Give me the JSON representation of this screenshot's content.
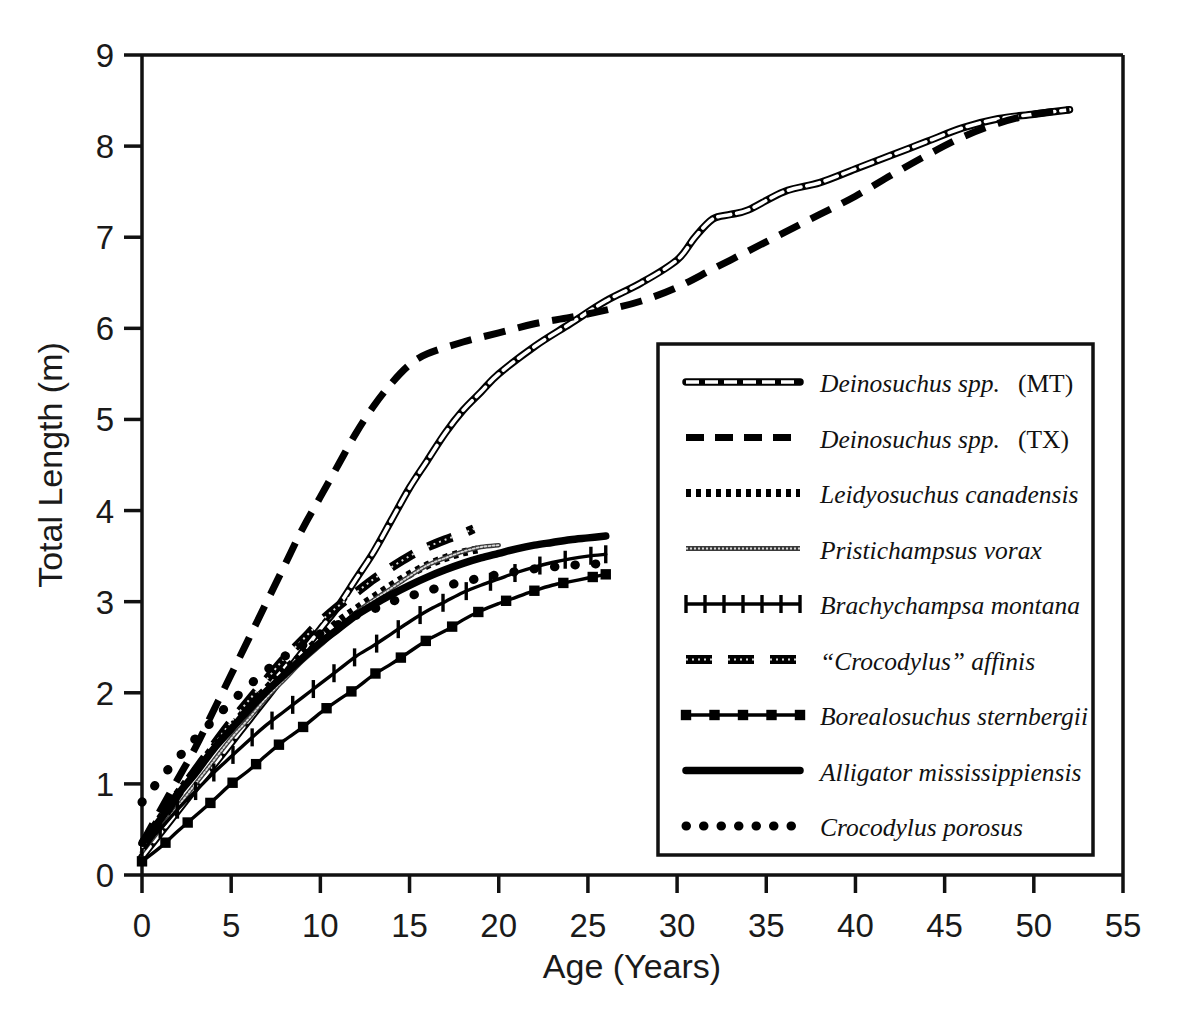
{
  "chart_data": {
    "type": "line",
    "title": "",
    "xlabel": "Age (Years)",
    "ylabel": "Total Length (m)",
    "xlim": [
      0,
      55
    ],
    "ylim": [
      0,
      9
    ],
    "xticks": [
      "0",
      "5",
      "10",
      "15",
      "20",
      "25",
      "30",
      "35",
      "40",
      "45",
      "50",
      "55"
    ],
    "yticks": [
      "0",
      "1",
      "2",
      "3",
      "4",
      "5",
      "6",
      "7",
      "8",
      "9"
    ],
    "grid": false,
    "legend_position": "inside-lower-right",
    "series": [
      {
        "name": "Deinosuchus spp.   (MT)",
        "style": "open-chain",
        "x": [
          0,
          1,
          2,
          3,
          4,
          5,
          6,
          7,
          8,
          9,
          10,
          11,
          12,
          13,
          14,
          15,
          16,
          17,
          18,
          19,
          20,
          22,
          24,
          26,
          28,
          30,
          31,
          32,
          33,
          34,
          36,
          38,
          40,
          42,
          44,
          46,
          48,
          50,
          52
        ],
        "y": [
          0.2,
          0.45,
          0.7,
          0.95,
          1.2,
          1.45,
          1.7,
          1.95,
          2.2,
          2.45,
          2.7,
          2.95,
          3.25,
          3.55,
          3.9,
          4.25,
          4.55,
          4.85,
          5.1,
          5.3,
          5.5,
          5.8,
          6.05,
          6.3,
          6.5,
          6.75,
          7.0,
          7.2,
          7.25,
          7.3,
          7.5,
          7.6,
          7.75,
          7.9,
          8.05,
          8.2,
          8.3,
          8.35,
          8.4
        ]
      },
      {
        "name": "Deinosuchus spp.   (TX)",
        "style": "dashed-heavy",
        "x": [
          0,
          1,
          2,
          3,
          4,
          5,
          6,
          7,
          8,
          9,
          10,
          11,
          12,
          13,
          14,
          15,
          16,
          18,
          20,
          22,
          24,
          26,
          28,
          30,
          32,
          34,
          36,
          38,
          40,
          42,
          44,
          46,
          48,
          50,
          52
        ],
        "y": [
          0.35,
          0.7,
          1.05,
          1.4,
          1.8,
          2.2,
          2.6,
          3.0,
          3.4,
          3.8,
          4.15,
          4.5,
          4.85,
          5.15,
          5.4,
          5.6,
          5.72,
          5.85,
          5.95,
          6.05,
          6.12,
          6.2,
          6.3,
          6.45,
          6.65,
          6.85,
          7.05,
          7.25,
          7.45,
          7.68,
          7.9,
          8.1,
          8.25,
          8.35,
          8.4
        ]
      },
      {
        "name": "Leidyosuchus canadensis",
        "style": "fine-dotted",
        "x": [
          0,
          1,
          2,
          3,
          4,
          5,
          6,
          7,
          8,
          9,
          10,
          11,
          12,
          13,
          14,
          15,
          16,
          17,
          18,
          19
        ],
        "y": [
          0.35,
          0.62,
          0.9,
          1.15,
          1.4,
          1.62,
          1.85,
          2.05,
          2.25,
          2.42,
          2.6,
          2.78,
          2.92,
          3.05,
          3.18,
          3.3,
          3.4,
          3.48,
          3.54,
          3.58
        ]
      },
      {
        "name": "Pristichampsus vorax",
        "style": "thin-gray",
        "x": [
          0,
          1,
          2,
          3,
          4,
          5,
          6,
          7,
          8,
          9,
          10,
          11,
          12,
          13,
          14,
          15,
          16,
          17,
          18,
          19,
          20
        ],
        "y": [
          0.25,
          0.5,
          0.75,
          1.0,
          1.25,
          1.5,
          1.72,
          1.95,
          2.15,
          2.35,
          2.52,
          2.7,
          2.88,
          3.02,
          3.15,
          3.28,
          3.4,
          3.48,
          3.55,
          3.6,
          3.62
        ]
      },
      {
        "name": "Brachychampsa montana",
        "style": "plus-marker",
        "x": [
          0,
          1,
          2,
          3,
          4,
          5,
          6,
          7,
          8,
          9,
          10,
          11,
          12,
          13,
          14,
          15,
          16,
          17,
          18,
          19,
          20,
          21,
          22,
          23,
          24,
          25,
          26
        ],
        "y": [
          0.3,
          0.5,
          0.72,
          0.92,
          1.12,
          1.3,
          1.48,
          1.65,
          1.8,
          1.95,
          2.1,
          2.25,
          2.4,
          2.52,
          2.65,
          2.78,
          2.9,
          3.0,
          3.1,
          3.18,
          3.25,
          3.32,
          3.38,
          3.43,
          3.47,
          3.5,
          3.52
        ]
      },
      {
        "name": "“Crocodylus” affinis",
        "style": "dashed-gray-heavy",
        "x": [
          0,
          1,
          2,
          3,
          4,
          5,
          6,
          7,
          8,
          9,
          10,
          11,
          12,
          13,
          14,
          15,
          16,
          17,
          18,
          18.6
        ],
        "y": [
          0.3,
          0.58,
          0.88,
          1.15,
          1.42,
          1.68,
          1.92,
          2.15,
          2.38,
          2.58,
          2.78,
          2.95,
          3.1,
          3.25,
          3.38,
          3.5,
          3.6,
          3.68,
          3.75,
          3.8
        ]
      },
      {
        "name": "Borealosuchus sternbergii",
        "style": "square-marker",
        "x": [
          0,
          1,
          2,
          3,
          4,
          5,
          6,
          7,
          8,
          9,
          10,
          11,
          12,
          13,
          14,
          15,
          16,
          17,
          18,
          19,
          20,
          21,
          22,
          23,
          24,
          25,
          26
        ],
        "y": [
          0.15,
          0.3,
          0.48,
          0.65,
          0.82,
          1.0,
          1.15,
          1.32,
          1.48,
          1.62,
          1.78,
          1.92,
          2.05,
          2.2,
          2.32,
          2.45,
          2.58,
          2.68,
          2.8,
          2.9,
          2.98,
          3.05,
          3.12,
          3.18,
          3.22,
          3.26,
          3.3
        ]
      },
      {
        "name": "Alligator mississippiensis",
        "style": "solid-heavy",
        "x": [
          0,
          1,
          2,
          3,
          4,
          5,
          6,
          7,
          8,
          9,
          10,
          11,
          12,
          13,
          14,
          15,
          16,
          17,
          18,
          19,
          20,
          21,
          22,
          23,
          24,
          25,
          26
        ],
        "y": [
          0.35,
          0.6,
          0.88,
          1.12,
          1.38,
          1.6,
          1.82,
          2.02,
          2.2,
          2.38,
          2.55,
          2.7,
          2.85,
          2.97,
          3.08,
          3.18,
          3.27,
          3.35,
          3.42,
          3.48,
          3.53,
          3.58,
          3.62,
          3.65,
          3.68,
          3.7,
          3.72
        ]
      },
      {
        "name": "Crocodylus porosus",
        "style": "coarse-dotted",
        "x": [
          0,
          1,
          2,
          3,
          4,
          5,
          6,
          7,
          8,
          9,
          10,
          11,
          12,
          13,
          14,
          15,
          16,
          17,
          18,
          19,
          20,
          21,
          22,
          23,
          24,
          25,
          26
        ],
        "y": [
          0.8,
          1.05,
          1.28,
          1.5,
          1.7,
          1.9,
          2.08,
          2.25,
          2.4,
          2.52,
          2.65,
          2.75,
          2.85,
          2.92,
          3.0,
          3.06,
          3.12,
          3.17,
          3.22,
          3.26,
          3.3,
          3.33,
          3.36,
          3.38,
          3.4,
          3.41,
          3.42
        ]
      }
    ]
  },
  "axes": {
    "x_title": "Age (Years)",
    "y_title": "Total Length (m)",
    "x_ticks": [
      "0",
      "5",
      "10",
      "15",
      "20",
      "25",
      "30",
      "35",
      "40",
      "45",
      "50",
      "55"
    ],
    "y_ticks": [
      "9",
      "8",
      "7",
      "6",
      "5",
      "4",
      "3",
      "2",
      "1",
      "0"
    ]
  },
  "legend": {
    "items": [
      {
        "label_italic": "Deinosuchus spp.",
        "label_roman": "(MT)",
        "swatch": "open-chain-swatch"
      },
      {
        "label_italic": "Deinosuchus spp.",
        "label_roman": "(TX)",
        "swatch": "dashed-heavy-swatch"
      },
      {
        "label_italic": "Leidyosuchus canadensis",
        "label_roman": "",
        "swatch": "fine-dotted-swatch"
      },
      {
        "label_italic": "Pristichampsus vorax",
        "label_roman": "",
        "swatch": "thin-gray-swatch"
      },
      {
        "label_italic": "Brachychampsa montana",
        "label_roman": "",
        "swatch": "plus-marker-swatch"
      },
      {
        "label_italic": "“Crocodylus” affinis",
        "label_roman": "",
        "swatch": "dashed-gray-heavy-swatch"
      },
      {
        "label_italic": "Borealosuchus sternbergii",
        "label_roman": "",
        "swatch": "square-marker-swatch"
      },
      {
        "label_italic": "Alligator mississippiensis",
        "label_roman": "",
        "swatch": "solid-heavy-swatch"
      },
      {
        "label_italic": "Crocodylus porosus",
        "label_roman": "",
        "swatch": "coarse-dotted-swatch"
      }
    ]
  },
  "colors": {
    "line": "#000000",
    "gray_line": "#555555",
    "background": "#ffffff",
    "text": "#1a1a1a"
  }
}
